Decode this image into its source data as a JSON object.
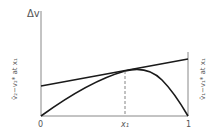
{
  "diagram": {
    "y_axis_label": "Δv",
    "x_ticks": [
      {
        "label": "0",
        "x": 41
      },
      {
        "label": "x₁",
        "x": 125
      },
      {
        "label": "1",
        "x": 188
      }
    ],
    "left_intercept_label": "v̄₂−v₂* at x₁",
    "right_intercept_label": "v̄₁−v₁* at x₁",
    "colors": {
      "curve": "#1a1a1a",
      "axis": "#777777",
      "text": "#555555"
    }
  }
}
